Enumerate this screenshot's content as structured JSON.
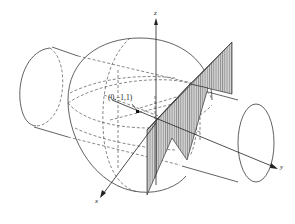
{
  "figure": {
    "axes": {
      "x_label": "x",
      "y_label": "y",
      "z_label": "z"
    },
    "point": {
      "label": "(0,−1,1)"
    },
    "colors": {
      "ink": "#3a3a3a",
      "hatch_fill": "#b8b8b8",
      "background": "#ffffff"
    }
  }
}
